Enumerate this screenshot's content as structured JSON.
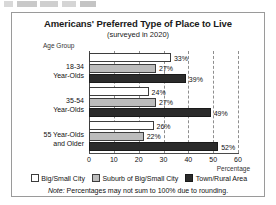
{
  "top_remnant": {
    "visible": true
  },
  "chart_data": {
    "type": "bar",
    "orientation": "horizontal",
    "title": "Americans' Preferred Type of Place to Live",
    "subtitle": "(surveyed in 2020)",
    "category_axis_title": "Age Group",
    "xlabel": "Percentage",
    "ylabel": "Age Group",
    "xlim": [
      0,
      60
    ],
    "xticks": [
      0,
      10,
      20,
      30,
      40,
      50,
      60
    ],
    "grid": true,
    "legend_position": "bottom",
    "categories": [
      {
        "line1": "18-34",
        "line2": "Year-Olds"
      },
      {
        "line1": "35-54",
        "line2": "Year-Olds"
      },
      {
        "line1": "55 Year-Olds",
        "line2": "and Older"
      }
    ],
    "series": [
      {
        "name": "Big/Small City",
        "color": "#ffffff",
        "values": [
          33,
          24,
          26
        ],
        "labels": [
          "33%",
          "24%",
          "26%"
        ]
      },
      {
        "name": "Suburb of Big/Small City",
        "color": "#bcbcbc",
        "values": [
          27,
          27,
          22
        ],
        "labels": [
          "27%",
          "27%",
          "22%"
        ]
      },
      {
        "name": "Town/Rural Area",
        "color": "#2b2b2b",
        "values": [
          39,
          49,
          52
        ],
        "labels": [
          "39%",
          "49%",
          "52%"
        ]
      }
    ],
    "note_prefix": "Note:",
    "note_text": "Percentages may not sum to 100% due to rounding."
  }
}
